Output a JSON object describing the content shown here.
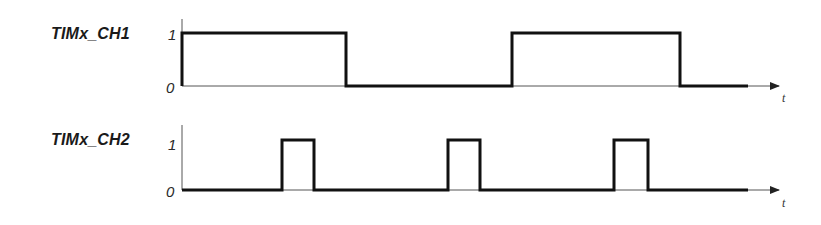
{
  "diagram": {
    "type": "timing-diagram",
    "colors": {
      "signal": "#111111",
      "axis": "#555555",
      "text": "#1a1a1a"
    },
    "signals": [
      {
        "name": "TIMx_CH1",
        "high_label": "1",
        "low_label": "0",
        "time_label": "t",
        "waveform": [
          {
            "t_start": 0,
            "t_end": 164,
            "level": 1
          },
          {
            "t_start": 164,
            "t_end": 330,
            "level": 0
          },
          {
            "t_start": 330,
            "t_end": 498,
            "level": 1
          },
          {
            "t_start": 498,
            "t_end": 566,
            "level": 0
          }
        ]
      },
      {
        "name": "TIMx_CH2",
        "high_label": "1",
        "low_label": "0",
        "time_label": "t",
        "waveform": [
          {
            "t_start": 0,
            "t_end": 100,
            "level": 0
          },
          {
            "t_start": 100,
            "t_end": 132,
            "level": 1
          },
          {
            "t_start": 132,
            "t_end": 266,
            "level": 0
          },
          {
            "t_start": 266,
            "t_end": 298,
            "level": 1
          },
          {
            "t_start": 298,
            "t_end": 432,
            "level": 0
          },
          {
            "t_start": 432,
            "t_end": 466,
            "level": 1
          },
          {
            "t_start": 466,
            "t_end": 566,
            "level": 0
          }
        ]
      }
    ]
  }
}
